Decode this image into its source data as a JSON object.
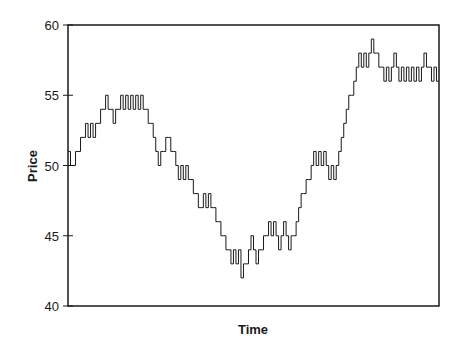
{
  "chart_data": {
    "type": "line",
    "style": "step",
    "title": "",
    "xlabel": "Time",
    "ylabel": "Price",
    "ylim": [
      40,
      60
    ],
    "yticks": [
      40,
      45,
      50,
      55,
      60
    ],
    "xticks": [],
    "grid": false,
    "legend": null,
    "series": [
      {
        "name": "Price",
        "values": [
          51,
          50,
          50,
          51,
          51,
          52,
          52,
          53,
          52,
          53,
          52,
          53,
          53,
          54,
          54,
          55,
          54,
          54,
          53,
          54,
          54,
          55,
          54,
          55,
          54,
          55,
          54,
          55,
          54,
          55,
          54,
          54,
          53,
          53,
          52,
          51,
          50,
          51,
          51,
          52,
          52,
          51,
          51,
          50,
          49,
          50,
          49,
          50,
          49,
          49,
          48,
          48,
          47,
          47,
          48,
          47,
          48,
          47,
          47,
          46,
          46,
          45,
          45,
          44,
          44,
          43,
          44,
          43,
          44,
          42,
          43,
          43,
          44,
          45,
          44,
          43,
          44,
          44,
          45,
          45,
          46,
          45,
          46,
          45,
          44,
          45,
          46,
          45,
          44,
          45,
          45,
          46,
          47,
          48,
          48,
          49,
          49,
          50,
          51,
          50,
          51,
          50,
          51,
          50,
          49,
          50,
          49,
          50,
          51,
          52,
          53,
          54,
          55,
          55,
          56,
          57,
          58,
          57,
          58,
          57,
          58,
          59,
          58,
          58,
          57,
          57,
          56,
          57,
          56,
          57,
          58,
          57,
          56,
          57,
          56,
          57,
          56,
          57,
          56,
          57,
          56,
          57,
          58,
          57,
          57,
          56,
          57,
          56
        ]
      }
    ]
  },
  "colors": {
    "line": "#1a1a1a",
    "axis": "#1a1a1a",
    "background": "#ffffff"
  }
}
